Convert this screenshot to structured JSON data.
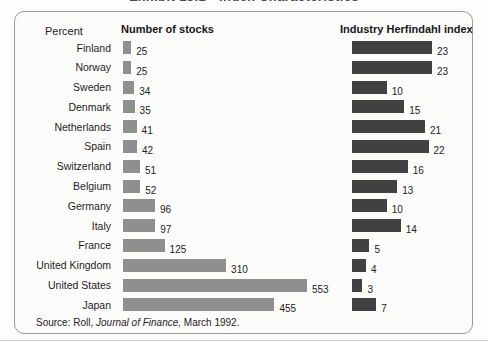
{
  "page": {
    "clipped_title": "Exhibit 13.1 • Index Characteristics"
  },
  "panel": {
    "axis_note": "Percent",
    "source": {
      "prefix": "Source: Roll, ",
      "italic": "Journal of Finance,",
      "suffix": " March 1992."
    }
  },
  "chart_data": {
    "type": "bar",
    "orientation": "horizontal",
    "value_labels": true,
    "grid": false,
    "legend_position": "column-headers",
    "categories": [
      "Finland",
      "Norway",
      "Sweden",
      "Denmark",
      "Netherlands",
      "Spain",
      "Switzerland",
      "Belgium",
      "Germany",
      "Italy",
      "France",
      "United Kingdom",
      "United States",
      "Japan"
    ],
    "series": [
      {
        "name": "Number of stocks",
        "values": [
          25,
          25,
          34,
          35,
          41,
          42,
          51,
          52,
          96,
          97,
          125,
          310,
          553,
          455
        ],
        "color": "#8f8f8f",
        "xlim": [
          0,
          553
        ]
      },
      {
        "name": "Industry Herfindahl index",
        "values": [
          23,
          23,
          10,
          15,
          21,
          22,
          16,
          13,
          10,
          14,
          5,
          4,
          3,
          7
        ],
        "color": "#414141",
        "xlim": [
          0,
          23
        ]
      }
    ],
    "source": "Roll, Journal of Finance, March 1992."
  },
  "colors": {
    "stocks_bar": "#8f8f8f",
    "herfindahl_bar": "#414141",
    "panel_border": "#9b9b9b"
  }
}
